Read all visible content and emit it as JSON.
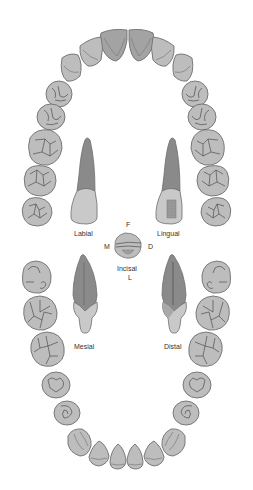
{
  "diagram": {
    "type": "dental arch diagram",
    "colors": {
      "tooth_fill": "#bdbdbd",
      "tooth_fill_dark": "#9e9e9e",
      "tooth_outline": "#6e6e6e",
      "groove_line": "#4d4d4d",
      "root_fill": "#8f8f8f",
      "crown_fill": "#c9c9c9",
      "background": "#ffffff",
      "label_text": "#333333"
    },
    "views": {
      "labial": "Labial",
      "lingual": "Lingual",
      "mesial": "Mesial",
      "distal": "Distal",
      "incisal": "Incisal"
    },
    "orientation": {
      "facial": "F",
      "mesial": "M",
      "distal": "D",
      "lingual": "L"
    },
    "arches": [
      {
        "name": "maxillary",
        "position": "upper",
        "tooth_count": 16
      },
      {
        "name": "mandibular",
        "position": "lower",
        "tooth_count": 16
      }
    ]
  }
}
